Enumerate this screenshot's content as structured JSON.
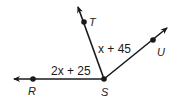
{
  "diagram": {
    "vertex": "S",
    "points": {
      "R": "R",
      "S": "S",
      "T": "T",
      "U": "U"
    },
    "angles": [
      {
        "name": "angle-RST",
        "expression": "2x + 25"
      },
      {
        "name": "angle-TSU",
        "expression": "x + 45"
      }
    ],
    "rays": [
      "SR",
      "ST",
      "SU"
    ],
    "colors": {
      "stroke": "#1a1a1a",
      "background": "#ffffff"
    }
  }
}
